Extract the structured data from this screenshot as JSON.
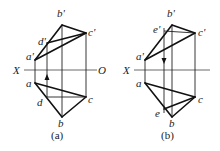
{
  "figures": [
    {
      "id": "a",
      "caption": "(a)",
      "axis_labels": {
        "left": "X",
        "right": "O"
      },
      "points": {
        "b_prime": {
          "label": "b'",
          "x": 62,
          "y": 25
        },
        "c_prime": {
          "label": "c'",
          "x": 86,
          "y": 33
        },
        "d_prime": {
          "label": "d'",
          "x": 47,
          "y": 43
        },
        "a_prime": {
          "label": "a'",
          "x": 35,
          "y": 60
        },
        "a": {
          "label": "a",
          "x": 35,
          "y": 83
        },
        "d": {
          "label": "d",
          "x": 47,
          "y": 97
        },
        "c": {
          "label": "c",
          "x": 86,
          "y": 97
        },
        "b": {
          "label": "b",
          "x": 62,
          "y": 117
        }
      },
      "arrow_direction": "up"
    },
    {
      "id": "b",
      "caption": "(b)",
      "axis_labels": {
        "left": "X",
        "right": ""
      },
      "points": {
        "b_prime": {
          "label": "b'",
          "x": 172,
          "y": 25
        },
        "e_prime": {
          "label": "e'",
          "x": 164,
          "y": 28
        },
        "c_prime": {
          "label": "c'",
          "x": 195,
          "y": 33
        },
        "a_prime": {
          "label": "a'",
          "x": 145,
          "y": 60
        },
        "a": {
          "label": "a",
          "x": 145,
          "y": 83
        },
        "e": {
          "label": "e",
          "x": 164,
          "y": 113
        },
        "c": {
          "label": "c",
          "x": 195,
          "y": 97
        },
        "b": {
          "label": "b",
          "x": 172,
          "y": 117
        }
      },
      "arrow_direction": "down"
    }
  ]
}
